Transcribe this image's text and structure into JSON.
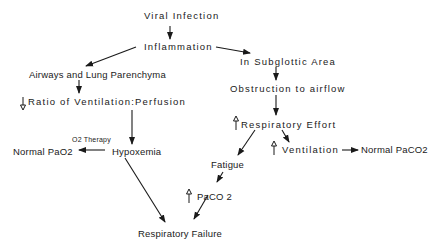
{
  "diagram": {
    "type": "flowchart",
    "nodes": {
      "viral_infection": "Viral  Infection",
      "inflammation": "Inflammation",
      "airways": "Airways and Lung Parenchyma",
      "subglottic": "In  Subglottic  Area",
      "ratio": "Ratio  of  Ventilation:Perfusion",
      "obstruction": "Obstruction  to  airflow",
      "o2_therapy": "O2 Therapy",
      "normal_pao2": "Normal PaO2",
      "hypoxemia": "Hypoxemia",
      "resp_effort": "Respiratory  Effort",
      "fatigue": "Fatigue",
      "ventilation": "Ventilation",
      "normal_paco2": "Normal PaCO2",
      "paco2": "PaCO 2",
      "resp_failure": "Respiratory  Failure"
    },
    "modifiers": {
      "ratio": "decrease",
      "resp_effort": "increase",
      "ventilation": "increase",
      "paco2": "increase"
    },
    "edges": [
      {
        "from": "Viral Infection",
        "to": "Inflammation"
      },
      {
        "from": "Inflammation",
        "to": "Airways and Lung Parenchyma"
      },
      {
        "from": "Inflammation",
        "to": "In Subglottic Area"
      },
      {
        "from": "Airways and Lung Parenchyma",
        "to": "Ratio of Ventilation:Perfusion"
      },
      {
        "from": "Ratio of Ventilation:Perfusion",
        "to": "Hypoxemia"
      },
      {
        "from": "Hypoxemia",
        "to": "Normal PaO2",
        "label": "O2 Therapy"
      },
      {
        "from": "Hypoxemia",
        "to": "Respiratory Failure"
      },
      {
        "from": "In Subglottic Area",
        "to": "Obstruction to airflow"
      },
      {
        "from": "Obstruction to airflow",
        "to": "Respiratory Effort"
      },
      {
        "from": "Respiratory Effort",
        "to": "Fatigue"
      },
      {
        "from": "Respiratory Effort",
        "to": "Ventilation"
      },
      {
        "from": "Ventilation",
        "to": "Normal PaCO2"
      },
      {
        "from": "Fatigue",
        "to": "PaCO 2"
      },
      {
        "from": "PaCO 2",
        "to": "Respiratory Failure"
      }
    ]
  }
}
